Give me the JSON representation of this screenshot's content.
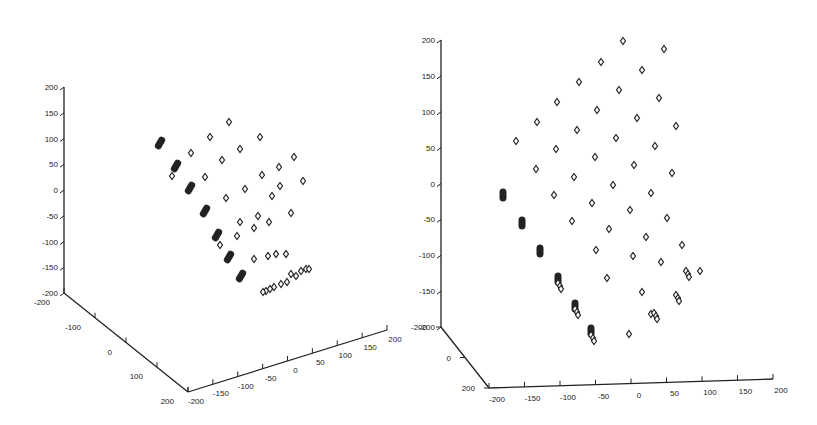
{
  "chart_data": [
    {
      "type": "scatter",
      "panel": "left",
      "title": "",
      "marker": "diamond",
      "projection": "3d",
      "z_axis": {
        "ticks": [
          "200",
          "150",
          "100",
          "50",
          "0",
          "-50",
          "-100",
          "-150",
          "-200"
        ],
        "range": [
          -200,
          200
        ]
      },
      "y_axis": {
        "ticks": [
          "-200",
          "-100",
          "0",
          "100",
          "200"
        ],
        "range": [
          -200,
          200
        ]
      },
      "x_axis": {
        "ticks": [
          "-200",
          "-150",
          "-100",
          "-50",
          "0",
          "50",
          "100",
          "150",
          "200"
        ],
        "range": [
          -200,
          200
        ]
      },
      "points_filled_px": [
        [
          160,
          143
        ],
        [
          176,
          166
        ],
        [
          190,
          188
        ],
        [
          205,
          211
        ],
        [
          217,
          235
        ],
        [
          229,
          257
        ],
        [
          241,
          276
        ]
      ],
      "points_open_px": [
        [
          229,
          122
        ],
        [
          210,
          137
        ],
        [
          191,
          153
        ],
        [
          260,
          137
        ],
        [
          240,
          149
        ],
        [
          222,
          160
        ],
        [
          205,
          177
        ],
        [
          172,
          176
        ],
        [
          294,
          157
        ],
        [
          279,
          167
        ],
        [
          262,
          175
        ],
        [
          245,
          189
        ],
        [
          226,
          198
        ],
        [
          280,
          186
        ],
        [
          303,
          181
        ],
        [
          291,
          213
        ],
        [
          272,
          196
        ],
        [
          258,
          216
        ],
        [
          240,
          222
        ],
        [
          220,
          245
        ],
        [
          237,
          236
        ],
        [
          254,
          228
        ],
        [
          269,
          222
        ],
        [
          254,
          259
        ],
        [
          268,
          256
        ],
        [
          276,
          254
        ],
        [
          286,
          254
        ],
        [
          291,
          274
        ],
        [
          306,
          269
        ],
        [
          274,
          287
        ],
        [
          270,
          289
        ],
        [
          266,
          291
        ],
        [
          263,
          292
        ],
        [
          281,
          284
        ],
        [
          287,
          282
        ],
        [
          296,
          276
        ],
        [
          301,
          271
        ],
        [
          309,
          269
        ]
      ]
    },
    {
      "type": "scatter",
      "panel": "right",
      "title": "",
      "marker": "diamond",
      "projection": "3d",
      "z_axis": {
        "ticks": [
          "200",
          "150",
          "100",
          "50",
          "0",
          "-50",
          "-100",
          "-150",
          "-200"
        ],
        "range": [
          -200,
          200
        ]
      },
      "y_axis": {
        "ticks": [
          "-200",
          "0",
          "200"
        ],
        "range": [
          -200,
          200
        ]
      },
      "x_axis": {
        "ticks": [
          "-200",
          "-150",
          "-100",
          "-50",
          "0",
          "50",
          "100",
          "150",
          "200"
        ],
        "range": [
          -200,
          200
        ]
      },
      "points_filled_px": [
        [
          503,
          195
        ],
        [
          522,
          223
        ],
        [
          540,
          251
        ],
        [
          558,
          279
        ],
        [
          575,
          306
        ],
        [
          591,
          331
        ]
      ],
      "points_open_px": [
        [
          623,
          41
        ],
        [
          664,
          49
        ],
        [
          601,
          62
        ],
        [
          642,
          70
        ],
        [
          579,
          82
        ],
        [
          619,
          90
        ],
        [
          659,
          98
        ],
        [
          557,
          102
        ],
        [
          597,
          110
        ],
        [
          637,
          118
        ],
        [
          676,
          126
        ],
        [
          537,
          122
        ],
        [
          577,
          130
        ],
        [
          616,
          138
        ],
        [
          655,
          146
        ],
        [
          516,
          141
        ],
        [
          556,
          149
        ],
        [
          595,
          157
        ],
        [
          634,
          165
        ],
        [
          672,
          173
        ],
        [
          536,
          169
        ],
        [
          574,
          177
        ],
        [
          613,
          185
        ],
        [
          651,
          193
        ],
        [
          554,
          195
        ],
        [
          592,
          203
        ],
        [
          630,
          210
        ],
        [
          667,
          218
        ],
        [
          572,
          221
        ],
        [
          609,
          229
        ],
        [
          646,
          237
        ],
        [
          682,
          245
        ],
        [
          596,
          250
        ],
        [
          633,
          256
        ],
        [
          661,
          262
        ],
        [
          700,
          271
        ],
        [
          607,
          278
        ],
        [
          642,
          292
        ],
        [
          576,
          311
        ],
        [
          651,
          314
        ],
        [
          629,
          334
        ]
      ],
      "points_cluster_px": [
        [
          558,
          283
        ],
        [
          575,
          309
        ],
        [
          591,
          335
        ],
        [
          686,
          271
        ],
        [
          676,
          295
        ],
        [
          654,
          313
        ]
      ]
    }
  ],
  "left": {
    "z_ticks": [
      "200",
      "150",
      "100",
      "50",
      "0",
      "-50",
      "-100",
      "-150",
      "-200"
    ],
    "y_ticks": [
      "-200",
      "-100",
      "0",
      "100",
      "200"
    ],
    "x_ticks": [
      "-200",
      "-150",
      "-100",
      "-50",
      "0",
      "50",
      "100",
      "150",
      "200"
    ]
  },
  "right": {
    "z_ticks": [
      "200",
      "150",
      "100",
      "50",
      "0",
      "-50",
      "-100",
      "-150",
      "-200"
    ],
    "y_ticks": [
      "-200",
      "0",
      "200"
    ],
    "x_ticks": [
      "-200",
      "-150",
      "-100",
      "-50",
      "0",
      "50",
      "100",
      "150",
      "200"
    ]
  }
}
